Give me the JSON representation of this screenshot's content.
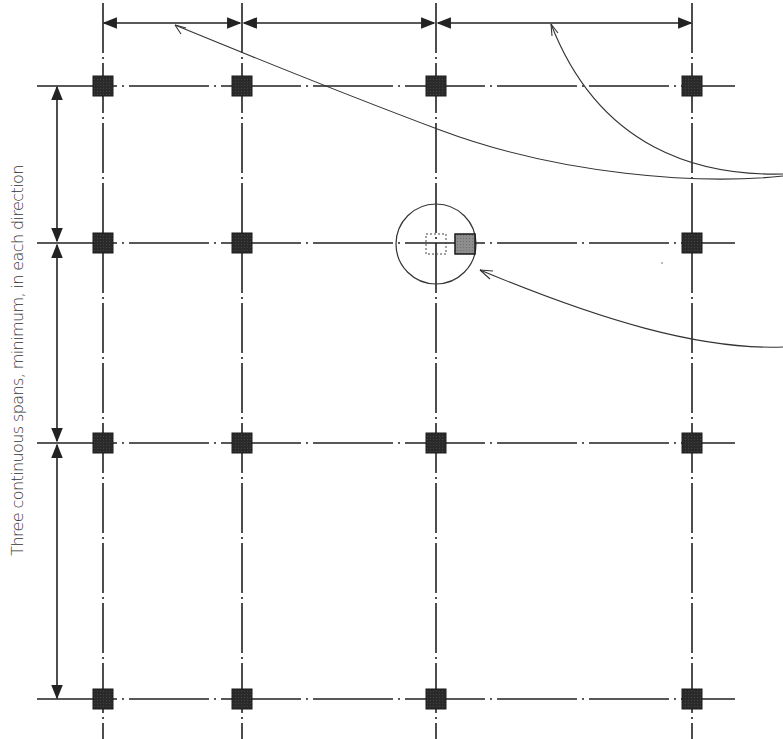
{
  "diagram": {
    "side_label": "Three continuous spans, minimum, in each direction",
    "colors": {
      "line": "#222222",
      "column_fill": "#2a2a2a",
      "offset_column_fill": "#8a8a8a",
      "background": "#ffffff"
    },
    "grid": {
      "columns_x": [
        103,
        242,
        436,
        692
      ],
      "rows_y": [
        86,
        243,
        443,
        699
      ],
      "column_size": 20
    },
    "dimension_lines": {
      "horizontal_y": 23,
      "vertical_x": 57,
      "horizontal_spans": 3,
      "vertical_spans": 3
    },
    "offset_column": {
      "grid_position": "row 2, column 3",
      "original_dashed_box": true,
      "shifted_solid_box": true,
      "highlight_circle": true
    },
    "leaders": [
      {
        "from": "right edge",
        "to": "first horizontal span dimension"
      },
      {
        "from": "right edge",
        "to": "third horizontal span dimension"
      },
      {
        "from": "right edge",
        "to": "offset column circle"
      }
    ]
  }
}
